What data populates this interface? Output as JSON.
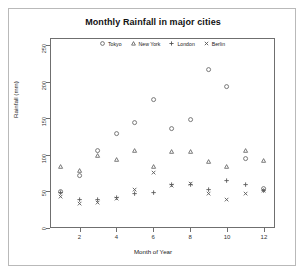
{
  "chart_data": {
    "type": "scatter",
    "title": "Monthly Rainfall in major cities",
    "xlabel": "Month of Year",
    "ylabel": "Rainfall (mm)",
    "xlim": [
      0.4,
      12.6
    ],
    "ylim": [
      0,
      260
    ],
    "grid": false,
    "legend_position": "top-inside-center",
    "x": [
      1,
      2,
      3,
      4,
      5,
      6,
      7,
      8,
      9,
      10,
      11,
      12
    ],
    "xticks": [
      "2",
      "4",
      "6",
      "8",
      "10",
      "12"
    ],
    "xtick_values": [
      2,
      4,
      6,
      8,
      10,
      12
    ],
    "yticks": [
      "0",
      "50",
      "100",
      "150",
      "200",
      "250"
    ],
    "ytick_values": [
      0,
      50,
      100,
      150,
      200,
      250
    ],
    "series": [
      {
        "name": "Tokyo",
        "symbol": "circle",
        "values": [
          49.9,
          71.5,
          106.4,
          129.2,
          144.0,
          176.0,
          135.6,
          148.5,
          216.4,
          194.1,
          95.6,
          54.4
        ]
      },
      {
        "name": "New York",
        "symbol": "triangle",
        "values": [
          83.6,
          78.8,
          98.5,
          93.4,
          106.0,
          84.5,
          105.0,
          104.3,
          91.2,
          83.5,
          106.6,
          92.3
        ]
      },
      {
        "name": "London",
        "symbol": "plus",
        "values": [
          48.9,
          38.8,
          39.3,
          41.4,
          47.0,
          48.3,
          59.0,
          59.6,
          52.4,
          65.2,
          59.3,
          51.2
        ]
      },
      {
        "name": "Berlin",
        "symbol": "cross",
        "values": [
          42.4,
          33.2,
          34.5,
          39.7,
          52.6,
          75.5,
          57.4,
          60.4,
          47.6,
          39.1,
          46.8,
          51.1
        ]
      }
    ]
  },
  "legend": {
    "items": [
      {
        "label": "Tokyo",
        "symbol": "circle-icon"
      },
      {
        "label": "New York",
        "symbol": "triangle-icon"
      },
      {
        "label": "London",
        "symbol": "plus-icon"
      },
      {
        "label": "Berlin",
        "symbol": "cross-icon"
      }
    ]
  }
}
